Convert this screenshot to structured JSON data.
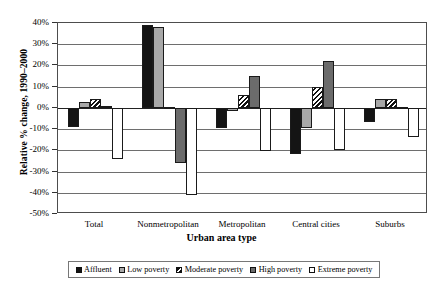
{
  "chart_data": {
    "type": "bar",
    "title": "",
    "xlabel": "Urban area type",
    "ylabel": "Relative % change, 1990–2000",
    "categories": [
      "Total",
      "Nonmetropolitan",
      "Metropolitan",
      "Central cities",
      "Suburbs"
    ],
    "ylim": [
      -50,
      40
    ],
    "ytick_labels": [
      "40%",
      "30%",
      "20%",
      "10%",
      "0%",
      "-10%",
      "-20%",
      "-30%",
      "-40%",
      "-50%"
    ],
    "ytick_values": [
      40,
      30,
      20,
      10,
      0,
      -10,
      -20,
      -30,
      -40,
      -50
    ],
    "grid": true,
    "legend_position": "bottom",
    "series": [
      {
        "name": "Affluent",
        "color": "#141414",
        "fill": "solid-black",
        "values": [
          -9,
          39,
          -9.5,
          -21.5,
          -6.5
        ]
      },
      {
        "name": "Low poverty",
        "color": "#a8a8a8",
        "fill": "solid-light-gray",
        "values": [
          3,
          38,
          -1.5,
          -9.5,
          4
        ]
      },
      {
        "name": "Moderate poverty",
        "color": "#ffffff",
        "fill": "diagonal-hatch",
        "values": [
          4,
          0.3,
          6,
          10,
          4
        ]
      },
      {
        "name": "High poverty",
        "color": "#6b6b6b",
        "fill": "solid-dark-gray",
        "values": [
          1,
          -26,
          15,
          22,
          0.2
        ]
      },
      {
        "name": "Extreme poverty",
        "color": "#ffffff",
        "fill": "hollow-white",
        "values": [
          -24,
          -41,
          -20.5,
          -20,
          -13.5
        ]
      }
    ]
  }
}
